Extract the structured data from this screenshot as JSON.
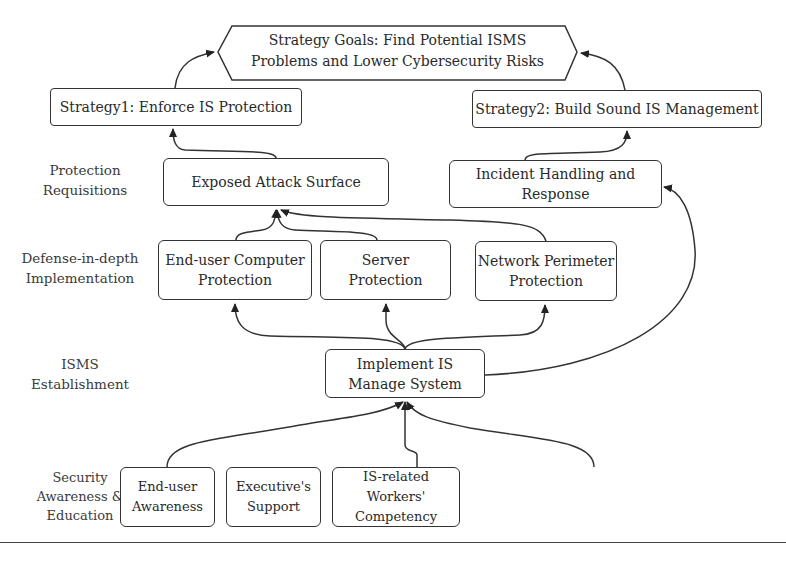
{
  "goal": {
    "line1": "Strategy Goals: Find Potential ISMS",
    "line2": "Problems and Lower Cybersecurity Risks"
  },
  "strategies": [
    {
      "label": "Strategy1: Enforce IS Protection"
    },
    {
      "label": "Strategy2: Build Sound IS Management"
    }
  ],
  "row_labels": [
    {
      "line1": "Protection",
      "line2": "Requisitions"
    },
    {
      "line1": "Defense-in-depth",
      "line2": "Implementation"
    },
    {
      "line1": "ISMS",
      "line2": "Establishment"
    },
    {
      "line1": "Security",
      "line2": "Awareness &",
      "line3": "Education"
    }
  ],
  "protection_requisitions": [
    {
      "line1": "Exposed Attack Surface"
    },
    {
      "line1": "Incident Handling and",
      "line2": "Response"
    }
  ],
  "defense_in_depth": [
    {
      "line1": "End-user Computer",
      "line2": "Protection"
    },
    {
      "line1": "Server",
      "line2": "Protection"
    },
    {
      "line1": "Network Perimeter",
      "line2": "Protection"
    }
  ],
  "isms": {
    "line1": "Implement IS",
    "line2": "Manage System"
  },
  "awareness": [
    {
      "line1": "End-user",
      "line2": "Awareness"
    },
    {
      "line1": "Executive's",
      "line2": "Support"
    },
    {
      "line1": "IS-related Workers'",
      "line2": "Competency"
    }
  ],
  "colors": {
    "stroke": "#333333",
    "background": "#ffffff",
    "text": "#2a2a2a"
  }
}
